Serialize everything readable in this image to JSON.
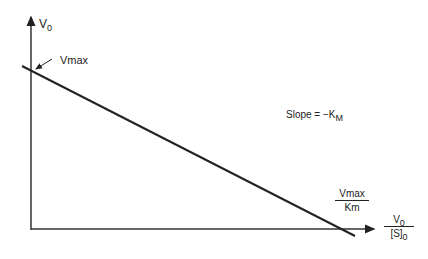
{
  "diagram": {
    "y_axis_label": {
      "main": "V",
      "sub": "0"
    },
    "x_axis_label": {
      "num_main": "V",
      "num_sub": "0",
      "den_main": "[S]",
      "den_sub": "0"
    },
    "y_intercept_label": "Vmax",
    "x_intercept_label": {
      "num": "Vmax",
      "den": "Km"
    },
    "slope_label": {
      "main": "Slope = −K",
      "sub": "M"
    },
    "colors": {
      "line": "#222222",
      "background": "#ffffff"
    }
  }
}
